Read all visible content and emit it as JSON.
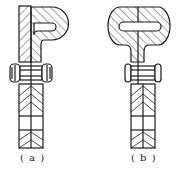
{
  "figure": {
    "panels": [
      {
        "id": "a",
        "caption": "( a )",
        "description": "P-shaped clamp fastened to a flat strip with a bolt"
      },
      {
        "id": "b",
        "caption": "( b )",
        "description": "T-shaped clamp with split stem fastened by a bolt"
      }
    ],
    "colors": {
      "line": "#1a1a1a",
      "background": "#ffffff"
    }
  }
}
